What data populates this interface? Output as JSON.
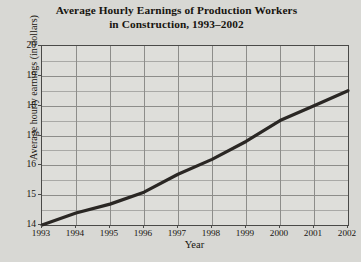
{
  "chart_data": {
    "type": "line",
    "title_lines": [
      "Average Hourly Earnings of Production Workers",
      "in Construction, 1993–2002"
    ],
    "title": "Average Hourly Earnings of Production Workers in Construction, 1993–2002",
    "xlabel": "Year",
    "ylabel": "Average hourly earnings (in dollars)",
    "x": [
      1993,
      1994,
      1995,
      1996,
      1997,
      1998,
      1999,
      2000,
      2001,
      2002
    ],
    "categories": [
      "1993",
      "1994",
      "1995",
      "1996",
      "1997",
      "1998",
      "1999",
      "2000",
      "2001",
      "2002"
    ],
    "values": [
      14.0,
      14.4,
      14.7,
      15.1,
      15.7,
      16.2,
      16.8,
      17.5,
      18.0,
      18.5
    ],
    "series": [
      {
        "name": "Average hourly earnings",
        "values": [
          14.0,
          14.4,
          14.7,
          15.1,
          15.7,
          16.2,
          16.8,
          17.5,
          18.0,
          18.5
        ]
      }
    ],
    "ylim": [
      14,
      20
    ],
    "xlim": [
      1993,
      2002
    ],
    "yticks": [
      14,
      15,
      16,
      17,
      18,
      19,
      20
    ],
    "ytick_labels": [
      "14",
      "15",
      "16",
      "17",
      "18",
      "19",
      "20"
    ],
    "minor_y_step": 0.5,
    "xticks": [
      1993,
      1994,
      1995,
      1996,
      1997,
      1998,
      1999,
      2000,
      2001,
      2002
    ],
    "grid": true,
    "legend": false,
    "line_color": "#2a2724",
    "plot_background": "#dededa",
    "figure_background": "#d8d8d4",
    "axis_color": "#4a4a48",
    "grid_color": "#8d8d8a",
    "minor_grid_color": "#a9a9a6"
  }
}
